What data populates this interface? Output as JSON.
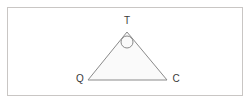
{
  "figure": {
    "type": "geometry-diagram",
    "canvas": {
      "width": 251,
      "height": 104,
      "background": "#ffffff"
    },
    "frame": {
      "name": "image-border",
      "x": 7,
      "y": 7,
      "width": 236,
      "height": 89,
      "stroke": "#c9c6c4",
      "stroke_width": 1,
      "fill": "#ffffff"
    },
    "shape": {
      "name": "triangle-TQC",
      "stroke": "#8a8a8a",
      "stroke_width": 1,
      "fill": "#fafafa",
      "points": "127,32 167,80 88,80",
      "vertices": [
        {
          "id": "T",
          "x": 127,
          "y": 32
        },
        {
          "id": "C",
          "x": 167,
          "y": 80
        },
        {
          "id": "Q",
          "x": 88,
          "y": 80
        }
      ]
    },
    "angle_marker": {
      "name": "apex-angle-circle",
      "cx": 127,
      "cy": 42,
      "r": 6,
      "stroke": "#8a8a8a",
      "stroke_width": 1,
      "fill": "none"
    },
    "labels": [
      {
        "id": "label-T",
        "text": "T",
        "x": 127,
        "y": 21,
        "color": "#3a3a3a"
      },
      {
        "id": "label-Q",
        "text": "Q",
        "x": 80,
        "y": 79,
        "color": "#3a3a3a"
      },
      {
        "id": "label-C",
        "text": "C",
        "x": 176,
        "y": 79,
        "color": "#3a3a3a"
      }
    ]
  }
}
